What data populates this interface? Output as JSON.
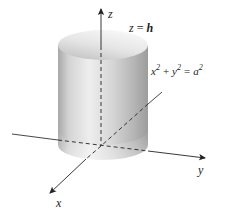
{
  "figure": {
    "type": "3D cylinder diagram",
    "colors": {
      "background": "#ffffff",
      "axis": "#222222",
      "cylinder_light": "#f2f2f2",
      "cylinder_mid": "#c8c8c8",
      "cylinder_dark": "#9a9a9a",
      "top_face_light": "#f0f0f0",
      "top_face_dark": "#bdbdbd"
    },
    "axes": {
      "z_label": "z",
      "y_label": "y",
      "x_label": "x"
    },
    "annotations": {
      "top_plane": {
        "lhs": "z",
        "eq": "=",
        "rhs": "h"
      },
      "surface_equation": {
        "x": "x",
        "x_exp": "2",
        "plus": "+",
        "y": "y",
        "y_exp": "2",
        "eq": "=",
        "a": "a",
        "a_exp": "2"
      }
    }
  }
}
